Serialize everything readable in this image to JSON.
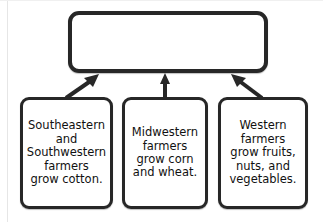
{
  "diagram": {
    "type": "flowchart-convergent",
    "title_box": {
      "label": "",
      "placeholder": ""
    },
    "nodes": [
      {
        "id": "southeast-southwest",
        "text": "Southeastern\nand\nSouthwestern\nfarmers\ngrow cotton."
      },
      {
        "id": "midwest",
        "text": "Midwestern\nfarmers\ngrow corn\nand wheat."
      },
      {
        "id": "west",
        "text": "Western\nfarmers\ngrow fruits,\nnuts, and\nvegetables."
      }
    ],
    "arrows": [
      {
        "id": "arrow-southeast-to-top",
        "direction": "up-right"
      },
      {
        "id": "arrow-midwest-to-top",
        "direction": "up"
      },
      {
        "id": "arrow-west-to-top",
        "direction": "up-left"
      }
    ],
    "colors": {
      "stroke": "#272727",
      "fill": "#ffffff",
      "text": "#111111",
      "background": "#ffffff"
    }
  }
}
